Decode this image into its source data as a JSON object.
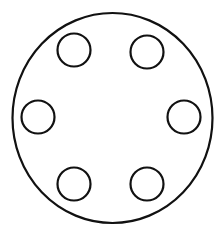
{
  "diagram": {
    "background": "#ffffff",
    "stroke_color": "#111111",
    "outer_circle": {
      "cx": 112.5,
      "cy": 118,
      "rx": 100,
      "ry": 105,
      "stroke_width": 2.2
    },
    "holes": [
      {
        "name": "hole-top-left",
        "cx": 74,
        "cy": 50,
        "r": 16.5
      },
      {
        "name": "hole-top-right",
        "cx": 147,
        "cy": 52,
        "r": 16.5
      },
      {
        "name": "hole-left",
        "cx": 38,
        "cy": 117,
        "r": 16.5
      },
      {
        "name": "hole-right",
        "cx": 184,
        "cy": 117,
        "r": 16.5
      },
      {
        "name": "hole-bottom-left",
        "cx": 74,
        "cy": 184,
        "r": 16.5
      },
      {
        "name": "hole-bottom-right",
        "cx": 147,
        "cy": 184,
        "r": 16.5
      }
    ],
    "hole_stroke_width": 2.2
  }
}
